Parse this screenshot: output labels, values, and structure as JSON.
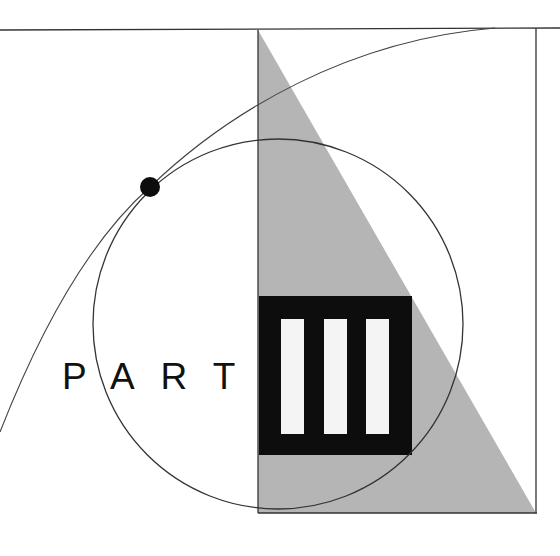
{
  "label": {
    "text": "PART"
  },
  "numeral": {
    "text": "III",
    "bars": 3
  },
  "colors": {
    "background": "#ffffff",
    "line": "#333333",
    "triangle_fill": "#b5b5b5",
    "block_fill": "#0d0d0d",
    "bar_fill": "#f4f4f4",
    "dot_fill": "#0d0d0d",
    "text": "#111111"
  }
}
